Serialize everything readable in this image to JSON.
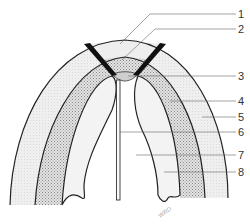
{
  "diagram": {
    "type": "labeled-cross-section",
    "labels": [
      {
        "number": "1",
        "y": 14
      },
      {
        "number": "2",
        "y": 29
      },
      {
        "number": "3",
        "y": 76
      },
      {
        "number": "4",
        "y": 101
      },
      {
        "number": "5",
        "y": 117
      },
      {
        "number": "6",
        "y": 132
      },
      {
        "number": "7",
        "y": 155
      },
      {
        "number": "8",
        "y": 172
      }
    ],
    "signature": "WRD",
    "colors": {
      "outline": "#222222",
      "light_fill": "#ececec",
      "stipple_fill": "#c9c9c9",
      "dark_band": "#111111",
      "leader_line": "#666666"
    }
  }
}
